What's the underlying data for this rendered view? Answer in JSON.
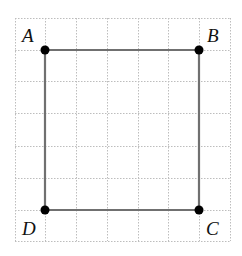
{
  "diagram": {
    "type": "square-on-grid",
    "grid": {
      "x_lines": [
        15,
        45,
        76,
        107,
        138,
        168,
        199,
        230
      ],
      "y_lines": [
        18,
        50,
        81,
        113,
        146,
        178,
        210,
        241
      ],
      "color": "#bdbdbd"
    },
    "shape_color": "#707070",
    "point_color": "#000000",
    "points": [
      {
        "label": "A",
        "x": 45,
        "y": 50,
        "lx": 22,
        "ly": 42
      },
      {
        "label": "B",
        "x": 199,
        "y": 50,
        "lx": 207,
        "ly": 42
      },
      {
        "label": "C",
        "x": 199,
        "y": 210,
        "lx": 206,
        "ly": 235
      },
      {
        "label": "D",
        "x": 45,
        "y": 210,
        "lx": 22,
        "ly": 235
      }
    ]
  }
}
